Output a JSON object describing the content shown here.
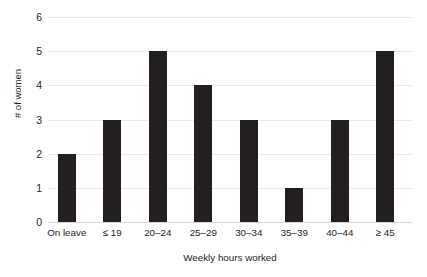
{
  "chart_data": {
    "type": "bar",
    "title": "",
    "xlabel": "Weekly hours worked",
    "ylabel": "# of women",
    "categories": [
      "On leave",
      "≤ 19",
      "20–24",
      "25–29",
      "30–34",
      "35–39",
      "40–44",
      "≥ 45"
    ],
    "values": [
      2,
      3,
      5,
      4,
      3,
      1,
      3,
      5
    ],
    "ylim": [
      0,
      6
    ],
    "ytick_labels": [
      "0",
      "1",
      "2",
      "3",
      "4",
      "5",
      "6"
    ],
    "ytick_values": [
      0,
      1,
      2,
      3,
      4,
      5,
      6
    ],
    "grid": true,
    "legend": false,
    "bar_color": "#231f20",
    "gridline_color": "#e9e9e9",
    "background_color": "#ffffff"
  }
}
